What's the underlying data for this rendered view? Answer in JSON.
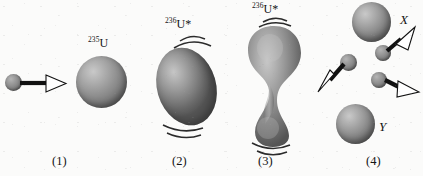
{
  "figure": {
    "background_color": "#fbfbfa",
    "ink_color": "#141414",
    "sphere_color": "#8a8a8a",
    "arrow_fill": "#ffffff",
    "arrow_stroke": "#111111"
  },
  "stages": [
    {
      "number": "(1)",
      "caption_x": 58,
      "nucleus_label_sup": "235",
      "nucleus_label_base": "U",
      "description": "Incident neutron approaching uranium-235 nucleus",
      "objects": [
        "incident-neutron",
        "motion-arrow",
        "u235-nucleus"
      ]
    },
    {
      "number": "(2)",
      "caption_x": 178,
      "nucleus_label_sup": "236",
      "nucleus_label_base": "U*",
      "description": "Excited compound nucleus uranium-236 oscillating into an ellipsoid",
      "objects": [
        "u236-excited-ellipsoid",
        "vibration-arcs-top",
        "vibration-arcs-bottom"
      ]
    },
    {
      "number": "(3)",
      "caption_x": 264,
      "nucleus_label_sup": "236",
      "nucleus_label_base": "U*",
      "description": "Uranium-236 elongating into a dumbbell shape with a neck",
      "objects": [
        "u236-dumbbell",
        "vibration-arcs-top",
        "vibration-arcs-bottom"
      ]
    },
    {
      "number": "(4)",
      "caption_x": 372,
      "description": "Scission into fission fragments X and Y with three emitted neutrons",
      "fragment_upper_label": "X",
      "fragment_lower_label": "Y",
      "emitted_neutron_count": 3,
      "objects": [
        "fragment-x",
        "fragment-y",
        "neutron-1",
        "neutron-2",
        "neutron-3",
        "neutron-arrows"
      ]
    }
  ],
  "labels": {
    "u235_sup": "235",
    "u235_base": "U",
    "u236_sup_stage2": "236",
    "u236_base_stage2": "U*",
    "u236_sup_stage3": "236",
    "u236_base_stage3": "U*",
    "fragment_x": "X",
    "fragment_y": "Y",
    "stage_1": "(1)",
    "stage_2": "(2)",
    "stage_3": "(3)",
    "stage_4": "(4)"
  }
}
